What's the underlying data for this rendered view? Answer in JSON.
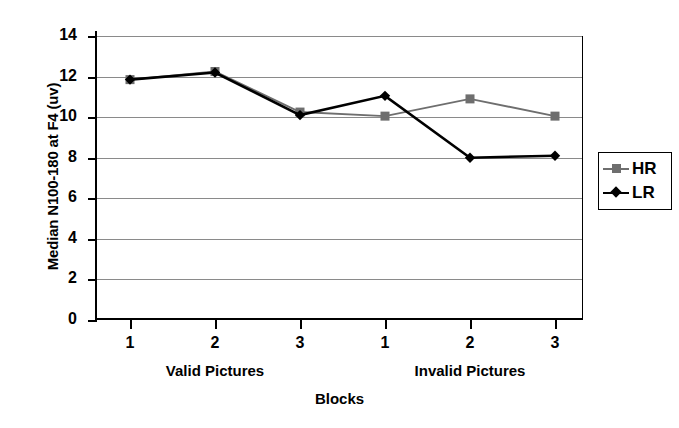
{
  "chart_data": {
    "type": "line",
    "title": "",
    "xlabel": "Blocks",
    "ylabel": "Median N100-180 at F4 (uv)",
    "ylim": [
      0,
      14
    ],
    "ytick_step": 2,
    "yticks": [
      14,
      12,
      10,
      8,
      6,
      4,
      2,
      0
    ],
    "grid": true,
    "legend_position": "right",
    "categories": [
      "1",
      "2",
      "3",
      "1",
      "2",
      "3"
    ],
    "group_labels": [
      "Valid Pictures",
      "Invalid Pictures"
    ],
    "groups": [
      {
        "label": "Valid Pictures",
        "categories": [
          "1",
          "2",
          "3"
        ]
      },
      {
        "label": "Invalid Pictures",
        "categories": [
          "1",
          "2",
          "3"
        ]
      }
    ],
    "series": [
      {
        "name": "HR",
        "marker": "square",
        "color": "#6e6e6e",
        "values": [
          11.85,
          12.25,
          10.25,
          10.05,
          10.9,
          10.05
        ]
      },
      {
        "name": "LR",
        "marker": "diamond",
        "color": "#000000",
        "values": [
          11.85,
          12.2,
          10.1,
          11.05,
          8.0,
          8.1
        ]
      }
    ]
  },
  "legend": {
    "entries": [
      {
        "label": "HR"
      },
      {
        "label": "LR"
      }
    ]
  },
  "colors": {
    "hr": "#6e6e6e",
    "lr": "#000000",
    "gridline": "#8a8a8a",
    "axis": "#000000",
    "background": "#ffffff"
  }
}
